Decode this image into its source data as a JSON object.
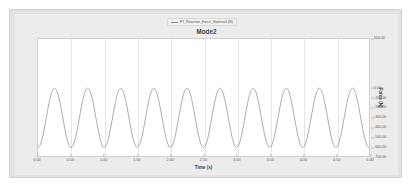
{
  "chart_data": {
    "type": "line",
    "title": "Mode2",
    "xlabel": "Time (s)",
    "ylabel": "Force (N)",
    "xlim": [
      0.0,
      5.0
    ],
    "ylim": [
      -700.0,
      500.0
    ],
    "grid": true,
    "grid_axis": "x",
    "legend_position": "top-center",
    "y_axis_side": "right",
    "xticks": [
      "0.00",
      "0.50",
      "1.00",
      "1.50",
      "2.00",
      "2.50",
      "3.00",
      "3.50",
      "4.00",
      "4.50",
      "5.00"
    ],
    "xtick_values": [
      0.0,
      0.5,
      1.0,
      1.5,
      2.0,
      2.5,
      3.0,
      3.5,
      4.0,
      4.5,
      5.0
    ],
    "yticks": [
      "500.00",
      "0.00",
      "-100.00",
      "-200.00",
      "-300.00",
      "-400.00",
      "-500.00",
      "-600.00",
      "-700.00"
    ],
    "ytick_values": [
      500.0,
      0.0,
      -100.0,
      -200.0,
      -300.0,
      -400.0,
      -500.0,
      -600.0,
      -700.0
    ],
    "series": [
      {
        "name": "FY_Reaction_Force_Nastran1 (N)",
        "color": "#7b8b9e",
        "waveform": "sine",
        "amplitude": 300.0,
        "offset": -300.0,
        "frequency_hz": 2.0,
        "period_s": 0.5,
        "phase": "trough-at-zero",
        "cycles": 10,
        "peak_value": 0.0,
        "trough_value": -600.0
      }
    ]
  },
  "legend": {
    "label": "FY_Reaction_Force_Nastran1 (N)"
  },
  "colors": {
    "series_line": "#7b8b9e",
    "plot_background": "#ffffff",
    "widget_background": "#e2e2e2",
    "gridline": "#e6e6e6",
    "axis_text": "#5a5a5a",
    "title_text": "#3f3f3f"
  }
}
